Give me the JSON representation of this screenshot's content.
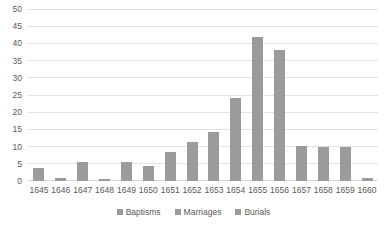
{
  "chart_data": {
    "type": "bar",
    "title": "",
    "xlabel": "",
    "ylabel": "",
    "ylim": [
      0,
      50
    ],
    "ytick_step": 5,
    "yticks": [
      50,
      45,
      40,
      35,
      30,
      25,
      20,
      15,
      10,
      5,
      0
    ],
    "grid": true,
    "legend_position": "bottom",
    "categories": [
      "1645",
      "1646",
      "1647",
      "1648",
      "1649",
      "1650",
      "1651",
      "1652",
      "1653",
      "1654",
      "1655",
      "1656",
      "1657",
      "1658",
      "1659",
      "1660"
    ],
    "series": [
      {
        "name": "Baptisms",
        "color": "#9b9b9b",
        "values": [
          3.8,
          0.8,
          5.6,
          0.7,
          5.6,
          4.5,
          8.5,
          11.3,
          14.4,
          24.2,
          42.2,
          38.2,
          10.1,
          10.0,
          9.9,
          1.0
        ]
      },
      {
        "name": "Marriages",
        "color": "#9b9b9b",
        "values": [
          0,
          0,
          0,
          0,
          0,
          0,
          0,
          0,
          0,
          0,
          0,
          0,
          0,
          0,
          0,
          0
        ]
      },
      {
        "name": "Burials",
        "color": "#9b9b9b",
        "values": [
          0,
          0,
          0,
          0,
          0,
          0,
          0,
          0,
          0,
          0,
          0,
          0,
          0,
          0,
          0,
          0
        ]
      }
    ]
  },
  "legend": {
    "entries": [
      {
        "label": "Baptisms"
      },
      {
        "label": "Marriages"
      },
      {
        "label": "Burials"
      }
    ]
  },
  "colors": {
    "bar": "#9b9b9b",
    "gridline": "#e2e2e2",
    "text": "#595959",
    "background": "#ffffff"
  }
}
